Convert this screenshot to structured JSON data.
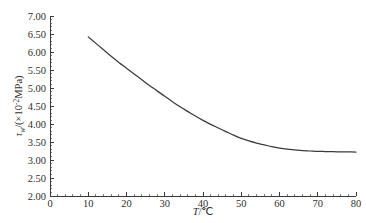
{
  "chart_data": {
    "type": "line",
    "title": "",
    "subtitle": "",
    "xlabel": "T/℃",
    "ylabel": "τw/(×10⁻²MPa)",
    "ylabel_parts": {
      "symbol": "τ",
      "subscript": "w",
      "separator": "/(×10",
      "exponent": "-2",
      "unit": "MPa)"
    },
    "xlabel_parts": {
      "symbol": "T",
      "separator": "/",
      "unit": "℃"
    },
    "xlim": [
      0,
      80
    ],
    "ylim": [
      2.0,
      7.0
    ],
    "xticks": [
      0,
      10,
      20,
      30,
      40,
      50,
      60,
      70,
      80
    ],
    "xtick_labels": [
      "0",
      "10",
      "20",
      "30",
      "40",
      "50",
      "60",
      "70",
      "80"
    ],
    "yticks": [
      2.0,
      2.5,
      3.0,
      3.5,
      4.0,
      4.5,
      5.0,
      5.5,
      6.0,
      6.5,
      7.0
    ],
    "ytick_labels": [
      "2.00",
      "2.50",
      "3.00",
      "3.50",
      "4.00",
      "4.50",
      "5.00",
      "5.50",
      "6.00",
      "6.50",
      "7.00"
    ],
    "x_minor_per_major": 5,
    "y_minor_per_major": 5,
    "grid": false,
    "legend": null,
    "series": [
      {
        "name": "wall shear stress vs temperature",
        "color": "#3b3b3b",
        "x": [
          10,
          12,
          14,
          16,
          18,
          20,
          22,
          24,
          26,
          28,
          30,
          32,
          34,
          36,
          38,
          40,
          42,
          44,
          46,
          48,
          50,
          52,
          54,
          56,
          58,
          60,
          62,
          64,
          66,
          68,
          70,
          72,
          74,
          76,
          78,
          80
        ],
        "values": [
          6.42,
          6.24,
          6.06,
          5.88,
          5.71,
          5.55,
          5.39,
          5.23,
          5.07,
          4.92,
          4.77,
          4.62,
          4.48,
          4.35,
          4.22,
          4.1,
          3.99,
          3.89,
          3.79,
          3.69,
          3.6,
          3.53,
          3.47,
          3.42,
          3.37,
          3.33,
          3.3,
          3.28,
          3.26,
          3.25,
          3.24,
          3.235,
          3.23,
          3.227,
          3.224,
          3.22
        ]
      }
    ],
    "annotations": []
  },
  "colors": {
    "background": "#ffffff",
    "axis": "#3a3a3a",
    "curve": "#3b3b3b",
    "text": "#2f2f2f"
  }
}
